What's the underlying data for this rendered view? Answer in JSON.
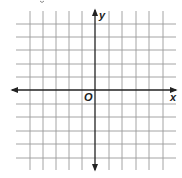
{
  "diagram": {
    "type": "coordinate-plane",
    "axis_labels": {
      "x": "x",
      "y": "y",
      "origin": "O"
    },
    "grid": {
      "vertical_lines_x": [
        30,
        43,
        56,
        69,
        82,
        95,
        109,
        122,
        136,
        149,
        163
      ],
      "horizontal_lines_y": [
        24,
        37,
        50,
        64,
        77,
        90,
        104,
        117,
        131,
        144,
        158
      ],
      "x_extent": [
        16,
        176
      ],
      "y_extent": [
        11,
        170
      ],
      "cells_left_of_origin": 5,
      "cells_right_of_origin": 5,
      "cells_above_origin": 5,
      "cells_below_origin": 5
    },
    "origin_px": [
      95,
      90
    ],
    "colors": {
      "grid": "#9a9a9a",
      "axis": "#222222",
      "background": "#ffffff"
    }
  }
}
